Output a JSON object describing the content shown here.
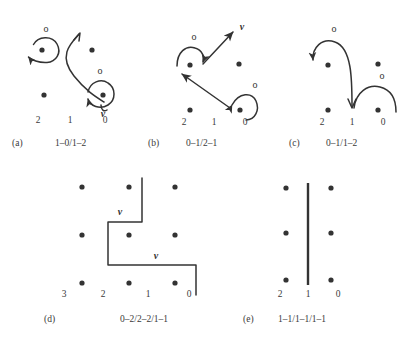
{
  "figure": {
    "title": "",
    "background_color": "#ffffff",
    "ink_color": "#333333"
  },
  "panels": [
    {
      "id": "a",
      "tag": "(a)",
      "caption": "1–0/1–2",
      "column_labels": [
        "2",
        "1",
        "0"
      ],
      "dots": [
        {
          "col": 2,
          "row": "top"
        },
        {
          "col": 0,
          "row": "top"
        },
        {
          "col": 2,
          "row": "bottom"
        },
        {
          "col": 0,
          "row": "bottom"
        }
      ],
      "annotations": [
        {
          "glyph": "o",
          "near": "top-left-dot"
        },
        {
          "glyph": "o",
          "near": "bottom-right-dot"
        },
        {
          "glyph": "v",
          "near": "bottom-right-dot-below"
        }
      ]
    },
    {
      "id": "b",
      "tag": "(b)",
      "caption": "0–1/2–1",
      "column_labels": [
        "2",
        "1",
        "0"
      ],
      "dots": [
        {
          "col": 2,
          "row": "top"
        },
        {
          "col": 0,
          "row": "top"
        },
        {
          "col": 2,
          "row": "bottom"
        },
        {
          "col": 0,
          "row": "bottom"
        }
      ],
      "annotations": [
        {
          "glyph": "o",
          "near": "top-left-dot"
        },
        {
          "glyph": "v",
          "near": "upper-right-arrow-tip"
        },
        {
          "glyph": "o",
          "near": "bottom-right-dot"
        }
      ]
    },
    {
      "id": "c",
      "tag": "(c)",
      "caption": "0–1/1–2",
      "column_labels": [
        "2",
        "1",
        "0"
      ],
      "dots": [
        {
          "col": 2,
          "row": "top"
        },
        {
          "col": 0,
          "row": "top"
        },
        {
          "col": 2,
          "row": "bottom"
        },
        {
          "col": 0,
          "row": "bottom"
        }
      ],
      "annotations": [
        {
          "glyph": "o",
          "near": "top-arc-apex"
        },
        {
          "glyph": "o",
          "near": "right-arc-apex"
        }
      ]
    },
    {
      "id": "d",
      "tag": "(d)",
      "caption": "0–2/2–2/1–1",
      "column_labels": [
        "3",
        "2",
        "1",
        "0"
      ],
      "dots": [
        {
          "col": 2,
          "row": "top"
        },
        {
          "col": 1,
          "row": "top"
        },
        {
          "col": 0,
          "row": "top"
        },
        {
          "col": 2,
          "row": "middle"
        },
        {
          "col": 1,
          "row": "middle"
        },
        {
          "col": 0,
          "row": "middle"
        },
        {
          "col": 2,
          "row": "bottom"
        },
        {
          "col": 1,
          "row": "bottom"
        },
        {
          "col": 0,
          "row": "bottom"
        }
      ],
      "annotations": [
        {
          "glyph": "v",
          "near": "upper-step"
        },
        {
          "glyph": "v",
          "near": "lower-step"
        }
      ]
    },
    {
      "id": "e",
      "tag": "(e)",
      "caption": "1–1/1–1/1–1",
      "column_labels": [
        "2",
        "1",
        "0"
      ],
      "dots": [
        {
          "col": 2,
          "row": "top"
        },
        {
          "col": 0,
          "row": "top"
        },
        {
          "col": 2,
          "row": "middle"
        },
        {
          "col": 0,
          "row": "middle"
        },
        {
          "col": 2,
          "row": "bottom"
        },
        {
          "col": 0,
          "row": "bottom"
        }
      ],
      "annotations": []
    }
  ]
}
